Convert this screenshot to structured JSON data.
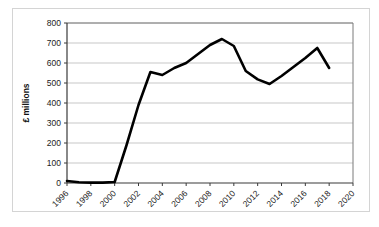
{
  "chart_data": {
    "type": "line",
    "title": "",
    "xlabel": "",
    "ylabel": "£ millions",
    "xlim": [
      1996,
      2020
    ],
    "ylim": [
      0,
      800
    ],
    "ytick_step": 100,
    "xtick_step": 2,
    "grid": true,
    "legend": "none",
    "y_ticks": [
      "0",
      "100",
      "200",
      "300",
      "400",
      "500",
      "600",
      "700",
      "800"
    ],
    "x_ticks": [
      "1996",
      "1998",
      "2000",
      "2002",
      "2004",
      "2006",
      "2008",
      "2010",
      "2012",
      "2014",
      "2016",
      "2018",
      "2020"
    ],
    "series": [
      {
        "name": "£ millions",
        "color": "#000000",
        "x": [
          1996,
          1997,
          1998,
          1999,
          2000,
          2001,
          2002,
          2003,
          2004,
          2005,
          2006,
          2007,
          2008,
          2009,
          2010,
          2011,
          2012,
          2013,
          2014,
          2015,
          2016,
          2017,
          2018
        ],
        "values": [
          10,
          4,
          2,
          2,
          5,
          190,
          390,
          555,
          540,
          575,
          600,
          645,
          690,
          720,
          685,
          560,
          518,
          495,
          535,
          580,
          625,
          675,
          575
        ]
      }
    ]
  },
  "colors": {
    "series": "#000000",
    "gridline": "#b9b9b9",
    "axis": "#3a3a3a",
    "frame": "#d4d4d4",
    "plot_border": "#7a7a7a",
    "background": "#ffffff"
  }
}
